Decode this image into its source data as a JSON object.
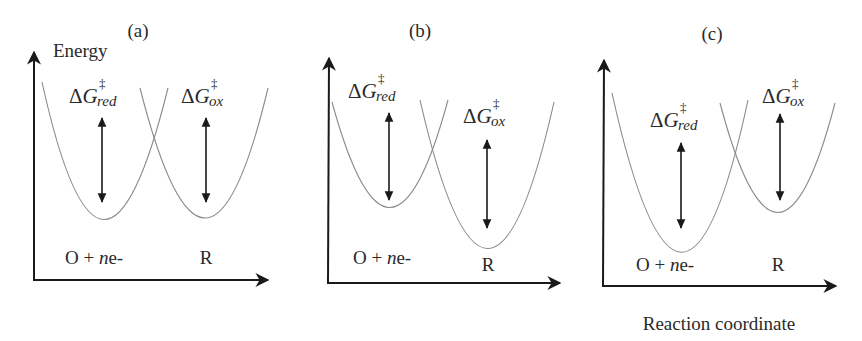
{
  "figure": {
    "y_axis_label": "Energy",
    "x_axis_label": "Reaction coordinate",
    "colors": {
      "axis": "#1a1a1a",
      "curve": "#8a8a8a",
      "text": "#2a2a2a"
    },
    "panels": [
      {
        "id": "a",
        "label": "(a)",
        "reactant_label": {
          "species": "O + ",
          "n": "n",
          "e": "e-"
        },
        "product_label": "R",
        "reactant_minimum_energy": 0.0,
        "product_minimum_energy": 0.0,
        "barrier_red": {
          "symbol": "ΔG",
          "dagger": "‡",
          "sub": "red"
        },
        "barrier_ox": {
          "symbol": "ΔG",
          "dagger": "‡",
          "sub": "ox"
        }
      },
      {
        "id": "b",
        "label": "(b)",
        "reactant_label": {
          "species": "O + ",
          "n": "n",
          "e": "e-"
        },
        "product_label": "R",
        "reactant_minimum_energy": 0.0,
        "product_minimum_energy": -0.35,
        "barrier_red": {
          "symbol": "ΔG",
          "dagger": "‡",
          "sub": "red"
        },
        "barrier_ox": {
          "symbol": "ΔG",
          "dagger": "‡",
          "sub": "ox"
        }
      },
      {
        "id": "c",
        "label": "(c)",
        "reactant_label": {
          "species": "O + ",
          "n": "n",
          "e": "e-"
        },
        "product_label": "R",
        "reactant_minimum_energy": -0.35,
        "product_minimum_energy": 0.0,
        "barrier_red": {
          "symbol": "ΔG",
          "dagger": "‡",
          "sub": "red"
        },
        "barrier_ox": {
          "symbol": "ΔG",
          "dagger": "‡",
          "sub": "ox"
        }
      }
    ]
  }
}
